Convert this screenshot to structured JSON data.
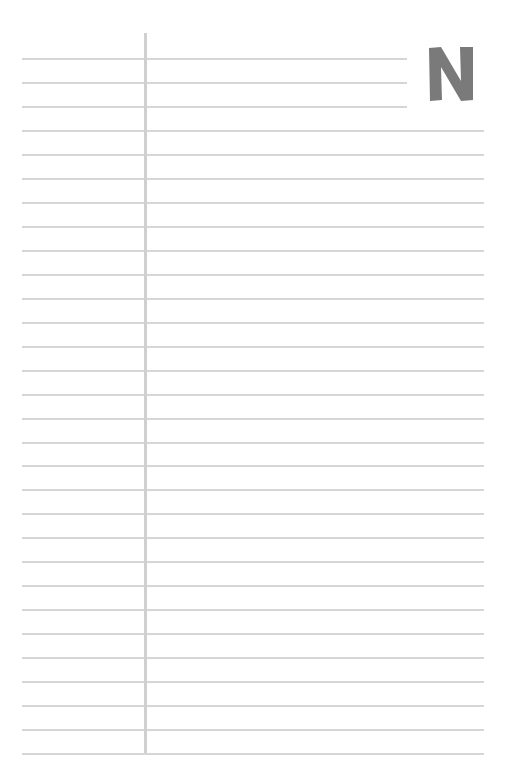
{
  "page": {
    "type": "lined-notebook-page",
    "line_count": 30,
    "first_line_y": 58,
    "line_spacing": 23.97,
    "line_left": 22,
    "line_right_full": 484,
    "line_right_short": 407,
    "short_line_count": 3,
    "margin_x": 144,
    "line_color": "#d6d6d6",
    "margin_color": "#d0d0d0"
  },
  "corner_letter": {
    "text": "N",
    "color": "#7a7a7a"
  }
}
